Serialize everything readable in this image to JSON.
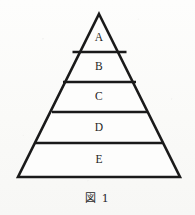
{
  "figure": {
    "caption": "図 1",
    "shape": "pyramid",
    "background_color": "#fbfbfa",
    "line_color": "#1a1a1a",
    "text_color": "#1d1d1d",
    "apex": {
      "x": 99,
      "y": 14
    },
    "base": {
      "left_x": 18,
      "right_x": 180,
      "y": 177
    },
    "bands": [
      {
        "label": "A",
        "label_x": 99,
        "label_y": 38,
        "top_y": 14,
        "bottom_y": 52,
        "top_left_x": 99,
        "top_right_x": 99,
        "bottom_left_x": 72.5,
        "bottom_right_x": 126.5
      },
      {
        "label": "B",
        "label_x": 99,
        "label_y": 67,
        "top_y": 52,
        "bottom_y": 82,
        "top_left_x": 72.5,
        "top_right_x": 126.5,
        "bottom_left_x": 63,
        "bottom_right_x": 136
      },
      {
        "label": "C",
        "label_x": 99,
        "label_y": 97,
        "top_y": 82,
        "bottom_y": 112,
        "top_left_x": 63,
        "top_right_x": 136,
        "bottom_left_x": 52,
        "bottom_right_x": 147
      },
      {
        "label": "D",
        "label_x": 99,
        "label_y": 128,
        "top_y": 112,
        "bottom_y": 143,
        "top_left_x": 52,
        "top_right_x": 147,
        "bottom_left_x": 35,
        "bottom_right_x": 164
      },
      {
        "label": "E",
        "label_x": 99,
        "label_y": 160,
        "top_y": 143,
        "bottom_y": 177,
        "top_left_x": 35,
        "top_right_x": 164,
        "bottom_left_x": 18,
        "bottom_right_x": 180
      }
    ]
  }
}
